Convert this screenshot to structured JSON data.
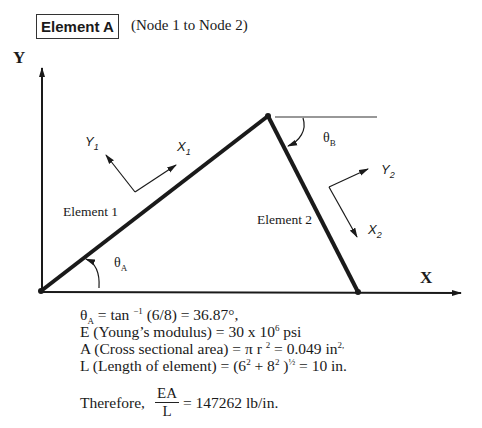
{
  "header": {
    "title": "Element A",
    "subtitle": "(Node 1 to Node 2)"
  },
  "diagram": {
    "global_axes": {
      "x_label": "X",
      "y_label": "Y"
    },
    "elements": [
      {
        "label": "Element 1",
        "local_x": "X",
        "local_x_sub": "1",
        "local_y": "Y",
        "local_y_sub": "1"
      },
      {
        "label": "Element 2",
        "local_x": "X",
        "local_x_sub": "2",
        "local_y": "Y",
        "local_y_sub": "2"
      }
    ],
    "angles": [
      {
        "symbol": "θ",
        "sub": "A"
      },
      {
        "symbol": "θ",
        "sub": "B"
      }
    ],
    "nodes": [
      {
        "id": 1,
        "x": 41,
        "y": 291
      },
      {
        "id": 2,
        "x": 268,
        "y": 116
      },
      {
        "id": 3,
        "x": 358,
        "y": 292
      }
    ],
    "line_color": "#1a1a1a"
  },
  "equations": {
    "theta": {
      "lhs": "θ",
      "lhs_sub": "A",
      "text1": " = tan ",
      "sup": "−1",
      "text2": " (6/8) = 36.87°,"
    },
    "modulus": {
      "text1": "E (Young’s modulus) = 30 x 10",
      "sup": "6",
      "text2": "  psi"
    },
    "area": {
      "text1": "A (Cross sectional area) = π r ",
      "sup1": "2",
      "text2": " = 0.049 in",
      "sup2": "2,"
    },
    "length": {
      "text1": "L (Length of element) = (6",
      "sup1": "2",
      "text2": " + 8",
      "sup2": "2",
      "text3": " )",
      "sup3": "½",
      "text4": "  = 10 in."
    },
    "result": {
      "prefix": "Therefore,",
      "numerator": "EA",
      "denominator": "L",
      "value": "=  147262 lb/in."
    }
  }
}
